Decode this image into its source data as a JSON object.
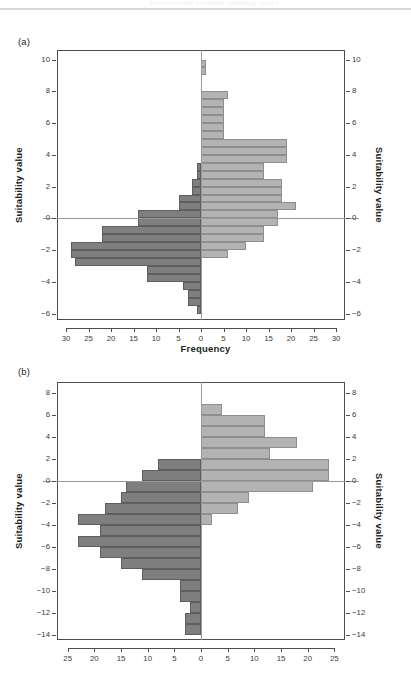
{
  "figure": {
    "header_ghost_text": "Environmental suitability modelling results",
    "background": "#ffffff",
    "bar_negative_color": "#7f7f7f",
    "bar_positive_color": "#b3b3b3",
    "frame_color": "#4d4d4d"
  },
  "panels": {
    "a": {
      "tag": "(a)",
      "ylabel_left": "Suitability value",
      "ylabel_right": "Suitability value",
      "xlabel": "Frequency",
      "xticks": [
        "30",
        "25",
        "20",
        "15",
        "10",
        "5",
        "0",
        "5",
        "10",
        "15",
        "20",
        "25",
        "30"
      ],
      "yticks": [
        "10",
        "8",
        "6",
        "4",
        "2",
        "0",
        "-2",
        "-4",
        "-6"
      ]
    },
    "b": {
      "tag": "(b)",
      "ylabel_left": "Suitability value",
      "ylabel_right": "Suitability value",
      "xlabel": "",
      "xticks": [
        "25",
        "20",
        "15",
        "10",
        "5",
        "0",
        "5",
        "10",
        "15",
        "20",
        "25"
      ],
      "yticks": [
        "8",
        "6",
        "4",
        "2",
        "0",
        "-2",
        "-4",
        "-6",
        "-8",
        "-10",
        "-12",
        "-14"
      ]
    }
  },
  "chart_data": [
    {
      "type": "bar",
      "orientation": "horizontal",
      "title": "(a)",
      "xlabel": "Frequency",
      "ylabel": "Suitability value",
      "xlim": [
        -32,
        32
      ],
      "ylim": [
        -6.4,
        10.6
      ],
      "bin_width": 0.5,
      "grid": false,
      "legend": "none",
      "note": "Back-to-back histogram: negative side (left, dark) and positive side (right, light). bin_center is the suitability value at the centre of each 0.5-wide bin; left_frequency is plotted leftwards from zero, right_frequency rightwards.",
      "series": [
        {
          "name": "left (dark)",
          "color": "#7f7f7f"
        },
        {
          "name": "right (light)",
          "color": "#b3b3b3"
        }
      ],
      "bins": [
        {
          "bin_center": 9.75,
          "left_frequency": 0,
          "right_frequency": 1
        },
        {
          "bin_center": 9.25,
          "left_frequency": 0,
          "right_frequency": 1
        },
        {
          "bin_center": 8.75,
          "left_frequency": 0,
          "right_frequency": 0
        },
        {
          "bin_center": 8.25,
          "left_frequency": 0,
          "right_frequency": 0
        },
        {
          "bin_center": 7.75,
          "left_frequency": 0,
          "right_frequency": 6
        },
        {
          "bin_center": 7.25,
          "left_frequency": 0,
          "right_frequency": 5
        },
        {
          "bin_center": 6.75,
          "left_frequency": 0,
          "right_frequency": 5
        },
        {
          "bin_center": 6.25,
          "left_frequency": 0,
          "right_frequency": 5
        },
        {
          "bin_center": 5.75,
          "left_frequency": 0,
          "right_frequency": 5
        },
        {
          "bin_center": 5.25,
          "left_frequency": 0,
          "right_frequency": 5
        },
        {
          "bin_center": 4.75,
          "left_frequency": 0,
          "right_frequency": 19
        },
        {
          "bin_center": 4.25,
          "left_frequency": 0,
          "right_frequency": 19
        },
        {
          "bin_center": 3.75,
          "left_frequency": 0,
          "right_frequency": 19
        },
        {
          "bin_center": 3.25,
          "left_frequency": 1,
          "right_frequency": 14
        },
        {
          "bin_center": 2.75,
          "left_frequency": 1,
          "right_frequency": 14
        },
        {
          "bin_center": 2.25,
          "left_frequency": 2,
          "right_frequency": 18
        },
        {
          "bin_center": 1.75,
          "left_frequency": 2,
          "right_frequency": 18
        },
        {
          "bin_center": 1.25,
          "left_frequency": 5,
          "right_frequency": 18
        },
        {
          "bin_center": 0.75,
          "left_frequency": 5,
          "right_frequency": 21
        },
        {
          "bin_center": 0.25,
          "left_frequency": 14,
          "right_frequency": 17
        },
        {
          "bin_center": -0.25,
          "left_frequency": 14,
          "right_frequency": 17
        },
        {
          "bin_center": -0.75,
          "left_frequency": 22,
          "right_frequency": 14
        },
        {
          "bin_center": -1.25,
          "left_frequency": 22,
          "right_frequency": 14
        },
        {
          "bin_center": -1.75,
          "left_frequency": 29,
          "right_frequency": 10
        },
        {
          "bin_center": -2.25,
          "left_frequency": 29,
          "right_frequency": 6
        },
        {
          "bin_center": -2.75,
          "left_frequency": 28,
          "right_frequency": 0
        },
        {
          "bin_center": -3.25,
          "left_frequency": 12,
          "right_frequency": 0
        },
        {
          "bin_center": -3.75,
          "left_frequency": 12,
          "right_frequency": 0
        },
        {
          "bin_center": -4.25,
          "left_frequency": 4,
          "right_frequency": 0
        },
        {
          "bin_center": -4.75,
          "left_frequency": 3,
          "right_frequency": 0
        },
        {
          "bin_center": -5.25,
          "left_frequency": 3,
          "right_frequency": 0
        },
        {
          "bin_center": -5.75,
          "left_frequency": 1,
          "right_frequency": 0
        }
      ]
    },
    {
      "type": "bar",
      "orientation": "horizontal",
      "title": "(b)",
      "xlabel": "",
      "ylabel": "Suitability value",
      "xlim": [
        -27,
        27
      ],
      "ylim": [
        -14.5,
        9
      ],
      "bin_width": 1.0,
      "grid": false,
      "legend": "none",
      "note": "Back-to-back histogram: negative side (left, dark) and positive side (right, light).",
      "series": [
        {
          "name": "left (dark)",
          "color": "#7f7f7f"
        },
        {
          "name": "right (light)",
          "color": "#b3b3b3"
        }
      ],
      "bins": [
        {
          "bin_center": 6.5,
          "left_frequency": 0,
          "right_frequency": 4
        },
        {
          "bin_center": 5.5,
          "left_frequency": 0,
          "right_frequency": 12
        },
        {
          "bin_center": 4.5,
          "left_frequency": 0,
          "right_frequency": 12
        },
        {
          "bin_center": 3.5,
          "left_frequency": 0,
          "right_frequency": 18
        },
        {
          "bin_center": 2.5,
          "left_frequency": 0,
          "right_frequency": 13
        },
        {
          "bin_center": 1.5,
          "left_frequency": 8,
          "right_frequency": 24
        },
        {
          "bin_center": 0.5,
          "left_frequency": 11,
          "right_frequency": 24
        },
        {
          "bin_center": -0.5,
          "left_frequency": 14,
          "right_frequency": 21
        },
        {
          "bin_center": -1.5,
          "left_frequency": 15,
          "right_frequency": 9
        },
        {
          "bin_center": -2.5,
          "left_frequency": 18,
          "right_frequency": 7
        },
        {
          "bin_center": -3.5,
          "left_frequency": 23,
          "right_frequency": 2
        },
        {
          "bin_center": -4.5,
          "left_frequency": 19,
          "right_frequency": 0
        },
        {
          "bin_center": -5.5,
          "left_frequency": 23,
          "right_frequency": 0
        },
        {
          "bin_center": -6.5,
          "left_frequency": 19,
          "right_frequency": 0
        },
        {
          "bin_center": -7.5,
          "left_frequency": 15,
          "right_frequency": 0
        },
        {
          "bin_center": -8.5,
          "left_frequency": 11,
          "right_frequency": 0
        },
        {
          "bin_center": -9.5,
          "left_frequency": 4,
          "right_frequency": 0
        },
        {
          "bin_center": -10.5,
          "left_frequency": 4,
          "right_frequency": 0
        },
        {
          "bin_center": -11.5,
          "left_frequency": 2,
          "right_frequency": 0
        },
        {
          "bin_center": -12.5,
          "left_frequency": 3,
          "right_frequency": 0
        },
        {
          "bin_center": -13.5,
          "left_frequency": 3,
          "right_frequency": 0
        }
      ]
    }
  ]
}
